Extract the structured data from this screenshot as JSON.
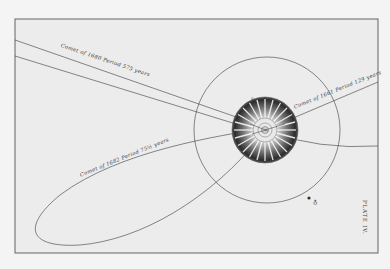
{
  "figure": {
    "plate_label": "PLATE IV.",
    "paper_color": "#ededed",
    "ink_color": "#3a3a3a",
    "comets": [
      {
        "id": "comet-1680",
        "label": "Comet of 1680 Period 575 years"
      },
      {
        "id": "comet-1682",
        "label": "Comet of 1682 Period 75½ years"
      },
      {
        "id": "comet-1661",
        "label": "Comet of 1661 Period 129 years"
      }
    ],
    "earth_symbol": "♁",
    "small_mark": "♀"
  }
}
